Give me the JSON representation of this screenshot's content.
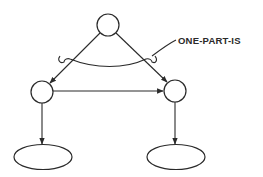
{
  "diagram": {
    "type": "semantic-network",
    "stroke_color": "#2a2a2a",
    "background": "#ffffff",
    "annotation": {
      "label": "ONE-PART-IS"
    },
    "nodes": [
      {
        "id": "top",
        "shape": "circle",
        "label": ""
      },
      {
        "id": "left",
        "shape": "circle",
        "label": ""
      },
      {
        "id": "right",
        "shape": "circle",
        "label": ""
      },
      {
        "id": "left-leaf",
        "shape": "ellipse",
        "label": ""
      },
      {
        "id": "right-leaf",
        "shape": "ellipse",
        "label": ""
      }
    ],
    "edges": [
      {
        "from": "top",
        "to": "left",
        "directed": true
      },
      {
        "from": "top",
        "to": "right",
        "directed": true
      },
      {
        "from": "left",
        "to": "right",
        "directed": true
      },
      {
        "from": "left",
        "to": "left-leaf",
        "directed": true
      },
      {
        "from": "right",
        "to": "right-leaf",
        "directed": true
      }
    ]
  }
}
